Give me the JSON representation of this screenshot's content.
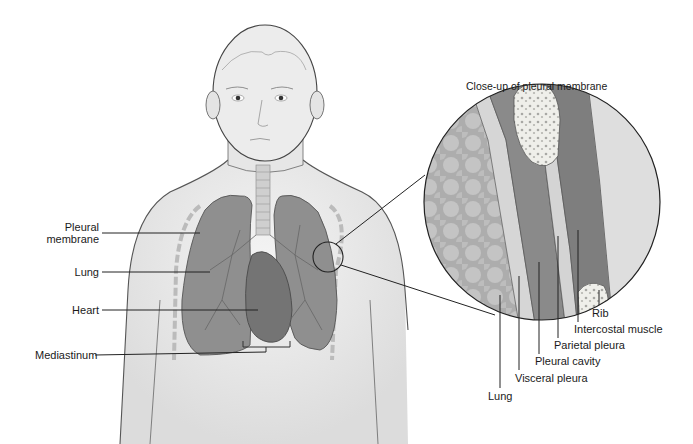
{
  "figure": {
    "title": "Close-up of pleural membrane",
    "left_labels": [
      {
        "id": "pleural-membrane",
        "line1": "Pleural",
        "line2": "membrane"
      },
      {
        "id": "lung",
        "text": "Lung"
      },
      {
        "id": "heart",
        "text": "Heart"
      },
      {
        "id": "mediastinum",
        "text": "Mediastinum"
      }
    ],
    "closeup_labels": [
      {
        "id": "rib",
        "text": "Rib"
      },
      {
        "id": "intercostal-muscle",
        "text": "Intercostal muscle"
      },
      {
        "id": "parietal-pleura",
        "text": "Parietal pleura"
      },
      {
        "id": "pleural-cavity",
        "text": "Pleural cavity"
      },
      {
        "id": "visceral-pleura",
        "text": "Visceral pleura"
      },
      {
        "id": "lung",
        "text": "Lung"
      }
    ],
    "colors": {
      "skin": "#e9e9e9",
      "outline": "#4a4a4a",
      "lung": "#8f8f8f",
      "heart": "#7a7a7a",
      "lung_tissue": "#b5b5b5",
      "pleural_cavity": "#8a8a8a",
      "muscle": "#7e7e7e",
      "pleura": "#d4d4d4",
      "bone": "#eeeeea",
      "label_line": "#222222"
    }
  }
}
